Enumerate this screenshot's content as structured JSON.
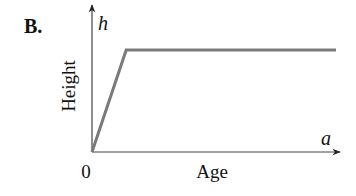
{
  "panel_label": "B.",
  "chart_data": {
    "type": "line",
    "title": "",
    "panel": "B.",
    "xlabel": "Age",
    "ylabel": "Height",
    "x_axis_symbol": "a",
    "y_axis_symbol": "h",
    "origin_label": "0",
    "grid": false,
    "legend": null,
    "series": [
      {
        "name": "height",
        "color": "#7a7a7a",
        "points_normalized": [
          [
            0,
            0
          ],
          [
            0.14,
            1.0
          ],
          [
            1.0,
            1.0
          ]
        ]
      }
    ],
    "xlim": [
      0,
      1
    ],
    "ylim": [
      0,
      1.45
    ]
  },
  "colors": {
    "axis": "#333333",
    "curve": "#7a7a7a",
    "text": "#111111"
  }
}
